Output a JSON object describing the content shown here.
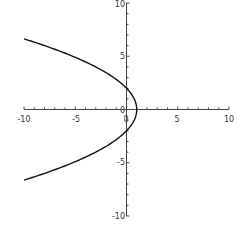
{
  "chart_data": {
    "type": "line",
    "title": "",
    "xlabel": "",
    "ylabel": "",
    "xlim": [
      -10,
      10
    ],
    "ylim": [
      -10,
      10
    ],
    "grid": false,
    "legend": null,
    "axes_through_origin": true,
    "x_ticks": [
      -10,
      -5,
      0,
      5,
      10
    ],
    "y_ticks": [
      -10,
      -5,
      0,
      5,
      10
    ],
    "x_tick_labels": [
      "-10",
      "-5",
      "0",
      "5",
      "10"
    ],
    "y_tick_labels": [
      "-10",
      "-5",
      "0",
      "5",
      "10"
    ],
    "minor_tick_step": 1,
    "series": [
      {
        "name": "x = 1 - y^2/4",
        "color": "#111111",
        "parametric_in": "y",
        "y_range": [
          -6.63,
          6.63
        ],
        "points": [
          [
            -10,
            6.63
          ],
          [
            -8,
            6.0
          ],
          [
            -6,
            5.29
          ],
          [
            -4,
            4.47
          ],
          [
            -3,
            4.0
          ],
          [
            -2,
            3.46
          ],
          [
            -1,
            2.83
          ],
          [
            0,
            2.0
          ],
          [
            0.5,
            1.41
          ],
          [
            0.75,
            1.0
          ],
          [
            1,
            0
          ],
          [
            0.75,
            -1.0
          ],
          [
            0.5,
            -1.41
          ],
          [
            0,
            -2.0
          ],
          [
            -1,
            -2.83
          ],
          [
            -2,
            -3.46
          ],
          [
            -3,
            -4.0
          ],
          [
            -4,
            -4.47
          ],
          [
            -6,
            -5.29
          ],
          [
            -8,
            -6.0
          ],
          [
            -10,
            -6.63
          ]
        ]
      }
    ]
  },
  "axes": {
    "x_labels": [
      "-10",
      "-5",
      "0",
      "5",
      "10"
    ],
    "y_labels": [
      "10",
      "5",
      "0",
      "-5",
      "-10"
    ]
  }
}
